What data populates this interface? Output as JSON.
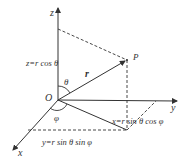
{
  "diagram": {
    "axes": {
      "x": "x",
      "y": "y",
      "z": "z"
    },
    "origin_label": "O",
    "point_label": "P",
    "radius_label": "r",
    "angle_polar": "θ",
    "angle_azimuth": "φ",
    "eq_z": "z=r cos θ",
    "eq_x": "x=r sin θ cos φ",
    "eq_y": "y=r sin θ sin φ",
    "colors": {
      "line": "#333333",
      "background": "#ffffff"
    }
  }
}
